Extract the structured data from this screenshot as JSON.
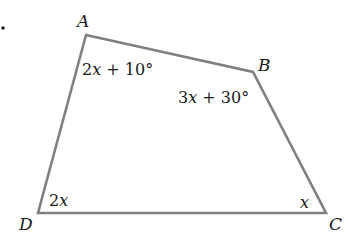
{
  "diagram": {
    "type": "quadrilateral",
    "stroke_color": "#808080",
    "vertices": [
      {
        "name": "A",
        "x": 86,
        "y": 35
      },
      {
        "name": "B",
        "x": 253,
        "y": 72
      },
      {
        "name": "C",
        "x": 326,
        "y": 213
      },
      {
        "name": "D",
        "x": 38,
        "y": 213
      }
    ],
    "vertex_labels": {
      "A": "A",
      "B": "B",
      "C": "C",
      "D": "D"
    },
    "angle_labels": {
      "A": {
        "coef": "2",
        "var": "x",
        "rest": " + 10°"
      },
      "B": {
        "coef": "3",
        "var": "x",
        "rest": " + 30°"
      },
      "C": {
        "coef": "",
        "var": "x",
        "rest": ""
      },
      "D": {
        "coef": "2",
        "var": "x",
        "rest": ""
      }
    }
  }
}
